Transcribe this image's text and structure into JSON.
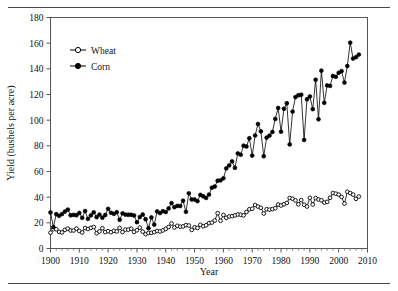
{
  "figure": {
    "has_top_rule": true,
    "has_bottom_rule": true,
    "background_color": "#ffffff",
    "frame_color": "#555555",
    "series_color": "#000000"
  },
  "axes": {
    "x_title": "Year",
    "y_title": "Yield (bushels per acre)",
    "x_ticks": [
      1900,
      1910,
      1920,
      1930,
      1940,
      1950,
      1960,
      1970,
      1980,
      1990,
      2000,
      2010
    ],
    "y_ticks": [
      0,
      20,
      40,
      60,
      80,
      100,
      120,
      140,
      160,
      180
    ],
    "x_minor_step": 2,
    "x_range": [
      1900,
      2010
    ],
    "y_range": [
      0,
      180
    ]
  },
  "legend": {
    "position": "top-left-inside",
    "entries": [
      {
        "label": "Wheat",
        "marker": "open-circle"
      },
      {
        "label": "Corn",
        "marker": "filled-circle"
      }
    ]
  },
  "chart_data": {
    "type": "line",
    "title": "",
    "subtitle": "",
    "xlabel": "Year",
    "ylabel": "Yield (bushels per acre)",
    "xlim": [
      1900,
      2010
    ],
    "ylim": [
      0,
      180
    ],
    "grid": false,
    "legend_position": "upper left (inside axes)",
    "x": [
      1900,
      1901,
      1902,
      1903,
      1904,
      1905,
      1906,
      1907,
      1908,
      1909,
      1910,
      1911,
      1912,
      1913,
      1914,
      1915,
      1916,
      1917,
      1918,
      1919,
      1920,
      1921,
      1922,
      1923,
      1924,
      1925,
      1926,
      1927,
      1928,
      1929,
      1930,
      1931,
      1932,
      1933,
      1934,
      1935,
      1936,
      1937,
      1938,
      1939,
      1940,
      1941,
      1942,
      1943,
      1944,
      1945,
      1946,
      1947,
      1948,
      1949,
      1950,
      1951,
      1952,
      1953,
      1954,
      1955,
      1956,
      1957,
      1958,
      1959,
      1960,
      1961,
      1962,
      1963,
      1964,
      1965,
      1966,
      1967,
      1968,
      1969,
      1970,
      1971,
      1972,
      1973,
      1974,
      1975,
      1976,
      1977,
      1978,
      1979,
      1980,
      1981,
      1982,
      1983,
      1984,
      1985,
      1986,
      1987,
      1988,
      1989,
      1990,
      1991,
      1992,
      1993,
      1994,
      1995,
      1996,
      1997,
      1998,
      1999,
      2000,
      2001,
      2002,
      2003,
      2004,
      2005,
      2006,
      2007
    ],
    "series": [
      {
        "name": "Wheat",
        "marker": "open-circle",
        "values": [
          12.3,
          15.0,
          15.0,
          12.9,
          12.5,
          14.5,
          15.5,
          14.0,
          14.0,
          15.5,
          13.7,
          12.5,
          15.9,
          15.2,
          16.1,
          16.7,
          11.9,
          13.3,
          15.8,
          12.8,
          13.5,
          12.7,
          13.8,
          13.3,
          16.0,
          12.8,
          14.7,
          14.7,
          15.4,
          13.0,
          14.2,
          16.3,
          13.1,
          11.2,
          12.1,
          12.2,
          12.8,
          13.6,
          13.3,
          14.1,
          15.3,
          16.8,
          19.5,
          16.4,
          17.7,
          17.0,
          17.2,
          18.2,
          17.9,
          14.5,
          16.5,
          16.0,
          18.4,
          17.3,
          18.1,
          19.8,
          20.2,
          21.8,
          27.5,
          21.6,
          26.1,
          23.9,
          25.0,
          25.2,
          25.8,
          26.5,
          26.3,
          25.8,
          28.4,
          30.6,
          31.0,
          33.9,
          32.7,
          31.7,
          27.3,
          30.6,
          30.3,
          30.7,
          31.4,
          34.2,
          33.5,
          34.5,
          35.5,
          39.4,
          38.8,
          37.5,
          34.4,
          37.7,
          34.1,
          32.7,
          39.5,
          34.3,
          39.3,
          38.2,
          37.6,
          35.8,
          36.3,
          39.5,
          43.2,
          42.7,
          42.0,
          40.2,
          35.0,
          44.2,
          43.2,
          42.0,
          38.7,
          40.5
        ]
      },
      {
        "name": "Corn",
        "marker": "filled-circle",
        "values": [
          28.1,
          16.7,
          26.8,
          25.5,
          26.8,
          28.8,
          30.3,
          25.9,
          26.2,
          25.9,
          27.7,
          23.9,
          29.2,
          23.1,
          25.8,
          28.2,
          24.4,
          26.4,
          24.0,
          26.1,
          30.9,
          27.8,
          27.0,
          28.3,
          22.4,
          27.4,
          26.4,
          26.3,
          26.3,
          25.7,
          20.5,
          24.5,
          26.5,
          22.8,
          15.8,
          24.2,
          18.6,
          28.9,
          27.6,
          29.1,
          28.4,
          31.2,
          35.4,
          32.2,
          33.2,
          33.1,
          37.2,
          28.6,
          43.0,
          38.2,
          38.2,
          36.9,
          41.8,
          40.7,
          39.4,
          42.0,
          47.4,
          48.3,
          52.8,
          53.1,
          54.7,
          62.4,
          64.7,
          67.9,
          62.9,
          74.1,
          73.1,
          80.1,
          79.5,
          85.9,
          72.4,
          88.1,
          97.0,
          91.3,
          71.9,
          86.4,
          88.0,
          90.8,
          101.0,
          109.5,
          91.0,
          108.9,
          113.2,
          81.1,
          106.7,
          118.0,
          119.4,
          119.8,
          84.6,
          116.3,
          118.5,
          108.6,
          131.5,
          100.7,
          138.6,
          113.5,
          127.1,
          126.7,
          134.4,
          133.8,
          136.9,
          138.2,
          129.3,
          142.2,
          160.4,
          148.0,
          149.1,
          151.1
        ]
      }
    ]
  }
}
